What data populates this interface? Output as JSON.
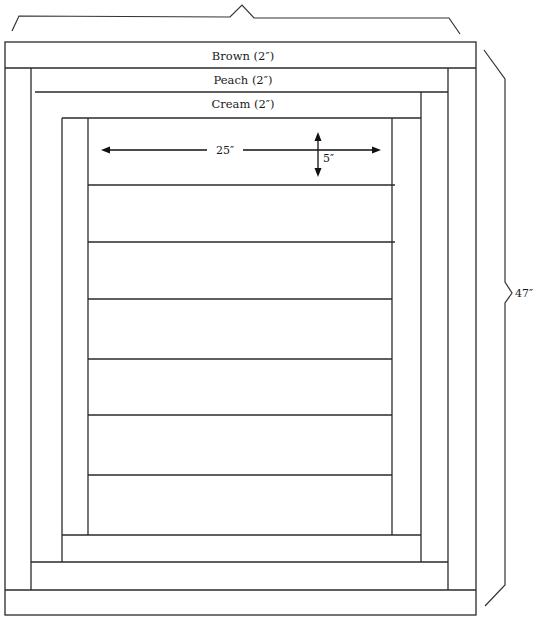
{
  "diagram": {
    "type": "quilt-layout",
    "borders": [
      {
        "name": "brown",
        "label": "Brown (2″)",
        "width_in": 2
      },
      {
        "name": "peach",
        "label": "Peach (2″)",
        "width_in": 2
      },
      {
        "name": "cream",
        "label": "Cream (2″)",
        "width_in": 2
      }
    ],
    "center_panel": {
      "strip_count": 7,
      "strip_length_label": "25″",
      "strip_height_label": "5″"
    },
    "overall": {
      "height_label": "47″",
      "width_label_visible": false
    },
    "colors": {
      "line": "#2a2a2a",
      "background": "#ffffff"
    }
  }
}
